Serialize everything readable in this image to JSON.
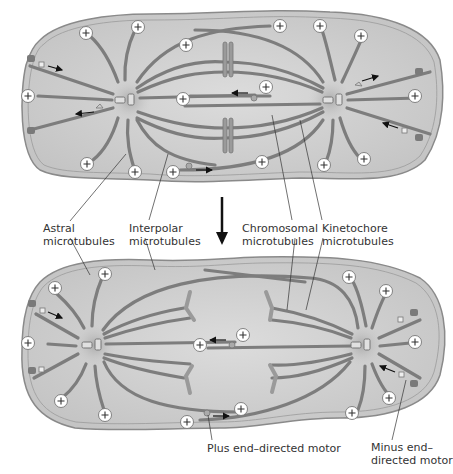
{
  "diagram": {
    "type": "mitotic-spindle-anaphase-B",
    "colors": {
      "background": "#ffffff",
      "cell_fill": "#cfcfcf",
      "cell_edge": "#888888",
      "centrosome_glow": "#b8b8b8",
      "microtubule": "#7d7d7d",
      "chromosome": "#9a9a9a",
      "plus_end_marker_fill": "#ffffff",
      "text": "#333333",
      "arrow": "#111111"
    },
    "panels": [
      {
        "name": "before",
        "description": "Metaphase spindle with chromosomes aligned at center"
      },
      {
        "name": "after",
        "description": "Anaphase spindle: chromatids separated toward poles, poles pushed apart"
      }
    ],
    "transition_arrow": "down-arrow",
    "plus_end_symbol": "⊕"
  },
  "labels": {
    "astral": [
      "Astral",
      "microtubules"
    ],
    "interpolar": [
      "Interpolar",
      "microtubules"
    ],
    "chromosomal": [
      "Chromosomal",
      "microtubules"
    ],
    "kinetochore": [
      "Kinetochore",
      "microtubules"
    ],
    "plus_motor": [
      "Plus end–directed motor"
    ],
    "minus_motor": [
      "Minus end–",
      "directed motor"
    ]
  }
}
